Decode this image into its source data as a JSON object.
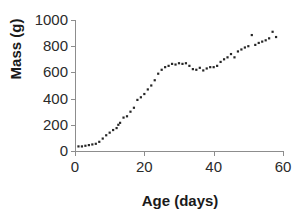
{
  "chart_data": {
    "type": "scatter",
    "title": "",
    "xlabel": "Age (days)",
    "ylabel": "Mass (g)",
    "xlim": [
      0,
      60
    ],
    "ylim": [
      0,
      1000
    ],
    "xticks": [
      0,
      20,
      40,
      60
    ],
    "yticks": [
      0,
      200,
      400,
      600,
      800,
      1000
    ],
    "xtick_labels": [
      "0",
      "20",
      "40",
      "60"
    ],
    "ytick_labels": [
      "0",
      "200",
      "400",
      "600",
      "800",
      "1000"
    ],
    "grid": false,
    "legend": false,
    "marker": "square",
    "marker_color": "#262626",
    "series": [
      {
        "name": "Mass",
        "x": [
          1,
          2,
          3,
          4,
          5,
          6,
          7,
          8,
          9,
          10,
          11,
          12,
          12.5,
          13,
          14,
          15,
          16,
          17,
          18,
          19,
          20,
          21,
          22,
          23,
          24,
          25,
          26,
          27,
          28,
          29,
          30,
          31,
          32,
          33,
          34,
          35,
          36,
          37,
          38,
          39,
          40,
          41,
          42,
          43,
          44,
          45,
          46,
          47,
          48,
          49,
          50,
          51,
          52,
          53,
          54,
          55,
          56,
          57,
          58
        ],
        "y": [
          35,
          35,
          40,
          45,
          50,
          55,
          70,
          95,
          120,
          140,
          160,
          175,
          200,
          215,
          255,
          265,
          300,
          330,
          390,
          410,
          435,
          470,
          500,
          540,
          590,
          620,
          640,
          650,
          665,
          660,
          670,
          665,
          670,
          650,
          625,
          620,
          635,
          615,
          630,
          640,
          640,
          650,
          680,
          700,
          715,
          740,
          715,
          760,
          775,
          790,
          800,
          885,
          810,
          825,
          835,
          845,
          860,
          910,
          870
        ]
      }
    ]
  },
  "axis_titles": {
    "y": "Mass (g)",
    "x": "Age (days)"
  }
}
